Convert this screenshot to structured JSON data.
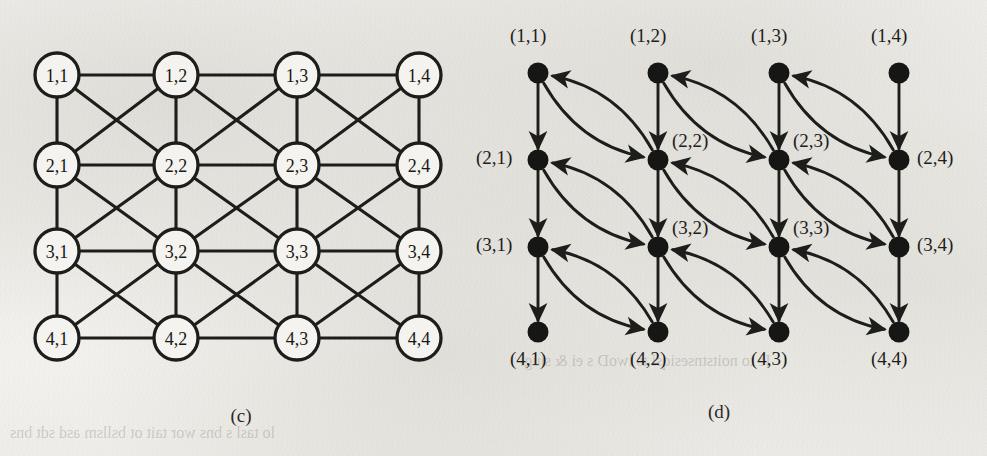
{
  "figure": {
    "title_absent": true,
    "background_color": "#f1f0ec",
    "ink_color": "#1d1d1b",
    "panels": [
      {
        "id": "c",
        "caption": "(c)",
        "type": "undirected-grid-graph",
        "description": "4x4 grid of labelled circular nodes with horizontal, vertical and both-diagonal edges",
        "rows": 4,
        "cols": 4,
        "node_shape": "circle",
        "node_labels": [
          [
            "1,1",
            "1,2",
            "1,3",
            "1,4"
          ],
          [
            "2,1",
            "2,2",
            "2,3",
            "2,4"
          ],
          [
            "3,1",
            "3,2",
            "3,3",
            "3,4"
          ],
          [
            "4,1",
            "4,2",
            "4,3",
            "4,4"
          ]
        ],
        "edges": {
          "horizontal": true,
          "vertical": true,
          "diagonal_down_right": true,
          "diagonal_down_left": true,
          "directed": false
        }
      },
      {
        "id": "d",
        "caption": "(d)",
        "type": "directed-grid-graph",
        "description": "4x4 grid of filled dot nodes; straight downward arrows on columns and curved bidirectional arc pairs between (r,c) and (r+1,c+1)",
        "rows": 4,
        "cols": 4,
        "node_shape": "filled-dot",
        "node_labels": [
          [
            "(1,1)",
            "(1,2)",
            "(1,3)",
            "(1,4)"
          ],
          [
            "(2,1)",
            "(2,2)",
            "(2,3)",
            "(2,4)"
          ],
          [
            "(3,1)",
            "(3,2)",
            "(3,3)",
            "(3,4)"
          ],
          [
            "(4,1)",
            "(4,2)",
            "(4,3)",
            "(4,4)"
          ]
        ],
        "label_placement": [
          [
            "above",
            "above",
            "above",
            "above"
          ],
          [
            "left",
            "upper-right",
            "upper-right",
            "right"
          ],
          [
            "left",
            "upper-right",
            "upper-right",
            "right"
          ],
          [
            "below",
            "below",
            "below",
            "below"
          ]
        ],
        "edges": {
          "vertical_down_arrow": true,
          "diagonal_arc_forward": "(r,c) -> (r+1,c+1)",
          "diagonal_arc_backward": "(r+1,c+1) -> (r,c)",
          "directed": true
        }
      }
    ]
  },
  "bleed_through": {
    "note": "faint mirrored text showing through from the reverse side of the printed page",
    "lines": [
      "lo tasl s bns wor tait ot bsllsm asd  sdt  bns",
      "Ie to noitstnsesiqsi ts lwoD s ei  & siugi"
    ]
  }
}
